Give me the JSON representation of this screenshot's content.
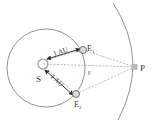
{
  "diagram": {
    "labels": {
      "sun": "S",
      "earth1": "E",
      "earth1_sub": "1",
      "earth2": "E",
      "earth2_sub": "2",
      "star": "P",
      "angle": "γ",
      "distance1": "1 AU",
      "distance2": "1 AU"
    },
    "colors": {
      "line": "#555555",
      "orbit": "#777777",
      "dashed": "#999999",
      "body_fill": "#dddddd",
      "star_fill": "#bbbbbb"
    }
  }
}
